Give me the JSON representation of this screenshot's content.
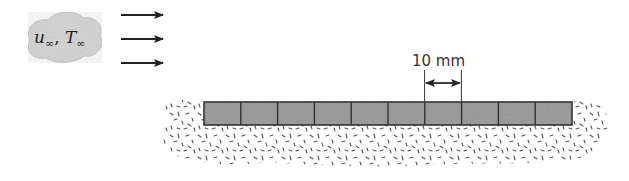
{
  "diagram": {
    "free_stream": {
      "velocity_symbol": "u",
      "velocity_subscript": "∞",
      "separator": ", ",
      "temperature_symbol": "T",
      "temperature_subscript": "∞"
    },
    "flow_arrows": {
      "count": 3,
      "direction": "right"
    },
    "dimension": {
      "label": "10 mm"
    },
    "strip": {
      "segment_count": 10,
      "fill_color": "#9a9a9a",
      "border_color": "#333333"
    },
    "insulation": {
      "pattern": "speckled"
    }
  }
}
